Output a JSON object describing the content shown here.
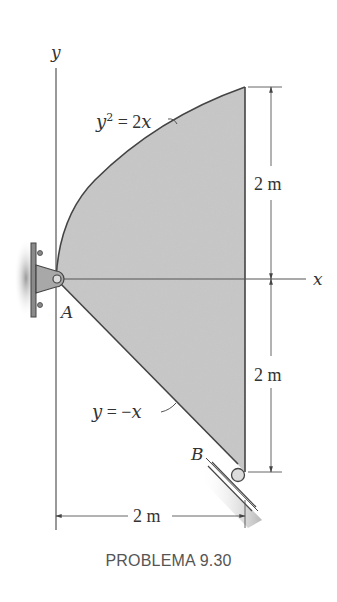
{
  "figure": {
    "caption": "PROBLEMA 9.30",
    "axes": {
      "x_label": "x",
      "y_label": "y"
    },
    "curves": {
      "upper": {
        "equation": "y² = 2x",
        "label_base": "y",
        "label_sup": "2",
        "label_rest": " = 2x"
      },
      "lower": {
        "equation": "y = −x",
        "label": "y = −x"
      }
    },
    "points": {
      "A": "A",
      "B": "B"
    },
    "dimensions": {
      "upper_height": "2 m",
      "lower_height": "2 m",
      "width": "2 m"
    },
    "supports": {
      "A": "pin-support",
      "B": "roller-on-incline"
    },
    "colors": {
      "fill": "#c9c9c9",
      "line": "#444444",
      "text": "#333333"
    }
  }
}
